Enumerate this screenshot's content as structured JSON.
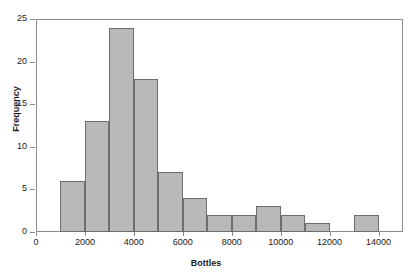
{
  "chart_data": {
    "type": "bar",
    "title": "",
    "xlabel": "Bottles",
    "ylabel": "Frequency",
    "xlim": [
      0,
      15000
    ],
    "ylim": [
      0,
      25
    ],
    "grid": false,
    "legend": null,
    "bin_width": 1000,
    "xticks": [
      0,
      2000,
      4000,
      6000,
      8000,
      10000,
      12000,
      14000
    ],
    "xtick_labels": [
      "0",
      "2000",
      "4000",
      "6000",
      "8000",
      "10000",
      "12000",
      "14000"
    ],
    "yticks": [
      0,
      5,
      10,
      15,
      20,
      25
    ],
    "ytick_labels": [
      "0",
      "5",
      "10",
      "15",
      "20",
      "25"
    ],
    "bar_color": "#b9b9b9",
    "bar_edge_color": "#6e6e6e",
    "axis_color": "#8c8c8c",
    "background": "#ffffff",
    "bins": [
      {
        "start": 1000,
        "end": 2000,
        "value": 6
      },
      {
        "start": 2000,
        "end": 3000,
        "value": 13
      },
      {
        "start": 3000,
        "end": 4000,
        "value": 24
      },
      {
        "start": 4000,
        "end": 5000,
        "value": 18
      },
      {
        "start": 5000,
        "end": 6000,
        "value": 7
      },
      {
        "start": 6000,
        "end": 7000,
        "value": 4
      },
      {
        "start": 7000,
        "end": 8000,
        "value": 2
      },
      {
        "start": 8000,
        "end": 9000,
        "value": 2
      },
      {
        "start": 9000,
        "end": 10000,
        "value": 3
      },
      {
        "start": 10000,
        "end": 11000,
        "value": 2
      },
      {
        "start": 11000,
        "end": 12000,
        "value": 1
      },
      {
        "start": 12000,
        "end": 13000,
        "value": 0
      },
      {
        "start": 13000,
        "end": 14000,
        "value": 2
      }
    ],
    "categories": [
      "1000-2000",
      "2000-3000",
      "3000-4000",
      "4000-5000",
      "5000-6000",
      "6000-7000",
      "7000-8000",
      "8000-9000",
      "9000-10000",
      "10000-11000",
      "11000-12000",
      "12000-13000",
      "13000-14000"
    ],
    "values": [
      6,
      13,
      24,
      18,
      7,
      4,
      2,
      2,
      3,
      2,
      1,
      0,
      2
    ]
  }
}
